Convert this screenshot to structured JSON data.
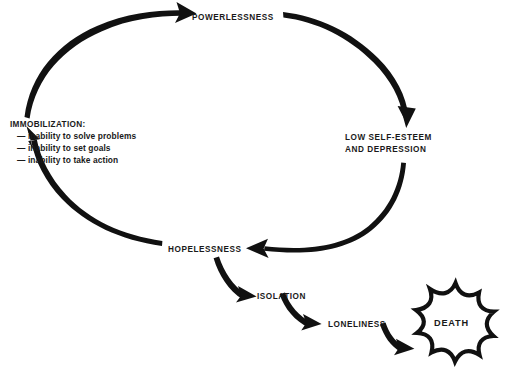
{
  "diagram": {
    "background_color": "#ffffff",
    "ink_color": "#111111",
    "nodes": {
      "powerlessness": {
        "label": "POWERLESSNESS"
      },
      "low_self_esteem": {
        "line1": "LOW SELF-ESTEEM",
        "line2": "AND DEPRESSION"
      },
      "hopelessness": {
        "label": "HOPELESSNESS"
      },
      "isolation": {
        "label": "ISOLATION"
      },
      "loneliness": {
        "label": "LONELINESS"
      },
      "death": {
        "label": "DEATH"
      },
      "immobilization": {
        "title": "IMMOBILIZATION:",
        "items": [
          "— inability to solve problems",
          "— inability to set goals",
          "— inability to take action"
        ]
      }
    },
    "arrows": [
      {
        "name": "immobilization-to-powerlessness",
        "from": "immobilization",
        "to": "powerlessness"
      },
      {
        "name": "powerlessness-to-low-self-esteem",
        "from": "powerlessness",
        "to": "low_self_esteem"
      },
      {
        "name": "low-self-esteem-to-hopelessness",
        "from": "low_self_esteem",
        "to": "hopelessness"
      },
      {
        "name": "hopelessness-to-immobilization",
        "from": "hopelessness",
        "to": "immobilization"
      },
      {
        "name": "hopelessness-to-isolation",
        "from": "hopelessness",
        "to": "isolation"
      },
      {
        "name": "isolation-to-loneliness",
        "from": "isolation",
        "to": "loneliness"
      },
      {
        "name": "loneliness-to-death",
        "from": "loneliness",
        "to": "death"
      }
    ]
  }
}
